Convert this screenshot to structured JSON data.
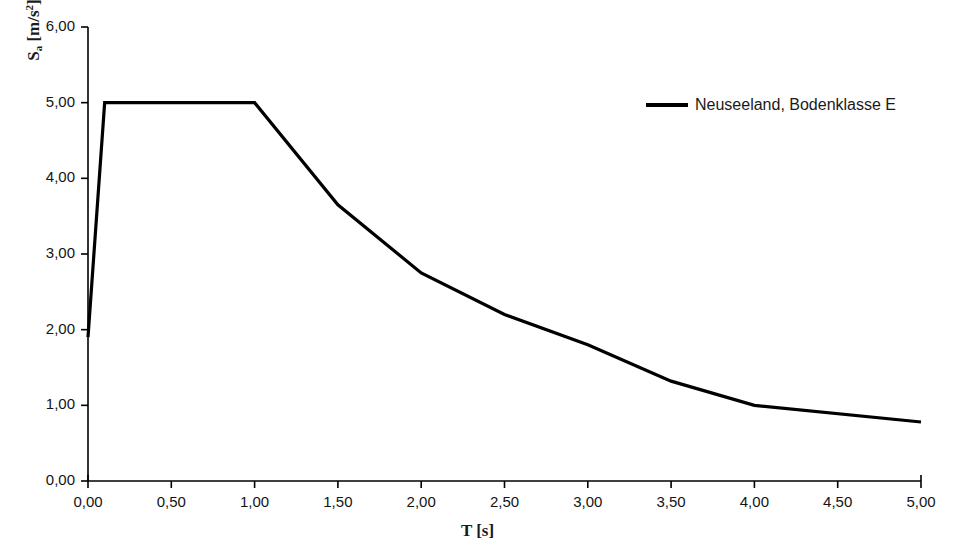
{
  "chart_data": {
    "type": "line",
    "title": "",
    "xlabel": "T [s]",
    "ylabel": "S_a [m/s^2]",
    "ylabel_base": "S",
    "ylabel_sub": "a",
    "ylabel_unit_open": " [m/s",
    "ylabel_unit_sup": "2",
    "ylabel_unit_close": "]",
    "xlim": [
      0,
      5
    ],
    "ylim": [
      0,
      6
    ],
    "grid": false,
    "legend_position": "top-right",
    "xticks": [
      0,
      0.5,
      1,
      1.5,
      2,
      2.5,
      3,
      3.5,
      4,
      4.5,
      5
    ],
    "xtick_labels": [
      "0,00",
      "0,50",
      "1,00",
      "1,50",
      "2,00",
      "2,50",
      "3,00",
      "3,50",
      "4,00",
      "4,50",
      "5,00"
    ],
    "yticks": [
      0,
      1,
      2,
      3,
      4,
      5,
      6
    ],
    "ytick_labels": [
      "0,00",
      "1,00",
      "2,00",
      "3,00",
      "4,00",
      "5,00",
      "6,00"
    ],
    "series": [
      {
        "name": "Neuseeland, Bodenklasse E",
        "color": "#000000",
        "line_width": 3.2,
        "x": [
          0.0,
          0.1,
          1.0,
          1.5,
          2.0,
          2.5,
          3.0,
          3.5,
          4.0,
          5.0
        ],
        "values": [
          1.9,
          5.0,
          5.0,
          3.65,
          2.75,
          2.2,
          1.8,
          1.32,
          1.0,
          0.78
        ]
      }
    ]
  },
  "legend": {
    "entries": [
      {
        "label": "Neuseeland, Bodenklasse E",
        "color": "#000000"
      }
    ]
  },
  "axes": {
    "x_title": "T [s]",
    "axis_color": "#000000"
  }
}
